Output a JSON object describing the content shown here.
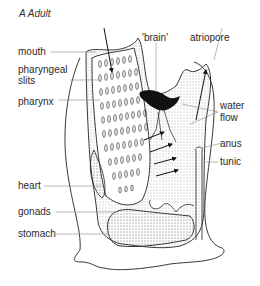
{
  "title": "A  Adult",
  "labels": {
    "mouth": "mouth",
    "pharyngeal_slits_1": "pharyngeal",
    "pharyngeal_slits_2": "slits",
    "pharynx": "pharynx",
    "brain": "'brain'",
    "atriopore": "atriopore",
    "water_flow_1": "water",
    "water_flow_2": "flow",
    "anus": "anus",
    "tunic": "tunic",
    "heart": "heart",
    "gonads": "gonads",
    "stomach": "stomach"
  },
  "colors": {
    "ink": "#1a1a1a",
    "leader": "#888888",
    "stipple": "#d8d8d8"
  }
}
